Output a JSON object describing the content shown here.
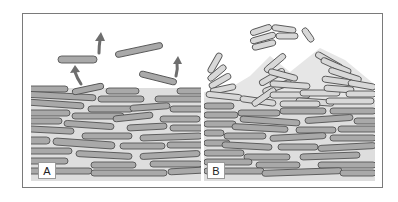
{
  "figure": {
    "panels": [
      {
        "id": "A",
        "label": "A",
        "description": "Flat layered cells with individual cells detaching (arrows pointing up)"
      },
      {
        "id": "B",
        "label": "B",
        "description": "Layered cells with clusters of light cells detaching from the surface"
      }
    ],
    "colors": {
      "frame": "#808080",
      "background": "#ffffff",
      "matrix": "#dcdcdc",
      "cell_dark": "#a8a8a8",
      "cell_light": "#d6d6d6",
      "cell_outline": "#555555",
      "arrow": "#6e6e6e"
    }
  }
}
